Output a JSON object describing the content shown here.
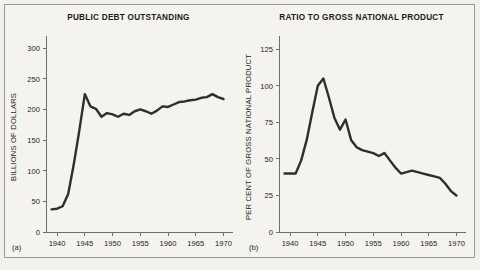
{
  "figure": {
    "background_color": "#f2f1ee",
    "frame_color": "#9a9a96",
    "line_color": "#2e2e2e",
    "axis_color": "#6e6e6b"
  },
  "panels": [
    {
      "tag": "(a)",
      "title": "PUBLIC DEBT OUTSTANDING"
    },
    {
      "tag": "(b)",
      "title": "RATIO TO GROSS NATIONAL PRODUCT"
    }
  ],
  "chart_data": [
    {
      "type": "line",
      "title": "PUBLIC DEBT OUTSTANDING",
      "panel_tag": "(a)",
      "xlabel": "",
      "ylabel": "BILLIONS OF DOLLARS",
      "xlim": [
        1938,
        1971
      ],
      "ylim": [
        0,
        310
      ],
      "xticks": [
        1940,
        1945,
        1950,
        1955,
        1960,
        1965,
        1970
      ],
      "xtick_labels": [
        "1940",
        "1945",
        "1950",
        "1955",
        "1960",
        "1965",
        "1970"
      ],
      "yticks": [
        0,
        50,
        100,
        150,
        200,
        250,
        300
      ],
      "ytick_labels": [
        "0",
        "50",
        "100",
        "150",
        "200",
        "250",
        "300"
      ],
      "grid": false,
      "legend": "none",
      "x": [
        1939,
        1940,
        1941,
        1942,
        1943,
        1944,
        1945,
        1946,
        1947,
        1948,
        1949,
        1950,
        1951,
        1952,
        1953,
        1954,
        1955,
        1956,
        1957,
        1958,
        1959,
        1960,
        1961,
        1962,
        1963,
        1964,
        1965,
        1966,
        1967,
        1968,
        1969,
        1970
      ],
      "values": [
        37,
        38,
        42,
        62,
        110,
        165,
        225,
        205,
        201,
        188,
        194,
        192,
        188,
        193,
        191,
        197,
        200,
        197,
        193,
        198,
        205,
        204,
        208,
        212,
        213,
        215,
        216,
        219,
        220,
        225,
        220,
        217
      ],
      "series": [
        {
          "name": "Public debt outstanding",
          "unit": "billions of dollars",
          "values": [
            37,
            38,
            42,
            62,
            110,
            165,
            225,
            205,
            201,
            188,
            194,
            192,
            188,
            193,
            191,
            197,
            200,
            197,
            193,
            198,
            205,
            204,
            208,
            212,
            213,
            215,
            216,
            219,
            220,
            225,
            220,
            217
          ]
        }
      ],
      "annotations": {
        "peak_year": 1945,
        "peak_value": 225
      }
    },
    {
      "type": "line",
      "title": "RATIO TO GROSS NATIONAL PRODUCT",
      "panel_tag": "(b)",
      "xlabel": "",
      "ylabel": "PER CENT OF GROSS NATIONAL PRODUCT",
      "xlim": [
        1938,
        1971
      ],
      "ylim": [
        0,
        130
      ],
      "xticks": [
        1940,
        1945,
        1950,
        1955,
        1960,
        1965,
        1970
      ],
      "xtick_labels": [
        "1940",
        "1945",
        "1950",
        "1955",
        "1960",
        "1965",
        "1970"
      ],
      "yticks": [
        0,
        25,
        50,
        75,
        100,
        125
      ],
      "ytick_labels": [
        "0",
        "25",
        "50",
        "75",
        "100",
        "125"
      ],
      "grid": false,
      "legend": "none",
      "x": [
        1939,
        1940,
        1941,
        1942,
        1943,
        1944,
        1945,
        1946,
        1947,
        1948,
        1949,
        1950,
        1951,
        1952,
        1953,
        1954,
        1955,
        1956,
        1957,
        1958,
        1959,
        1960,
        1961,
        1962,
        1963,
        1964,
        1965,
        1966,
        1967,
        1968,
        1969,
        1970
      ],
      "values": [
        40,
        40,
        40,
        49,
        63,
        82,
        100,
        105,
        92,
        78,
        70,
        77,
        63,
        58,
        56,
        55,
        54,
        52,
        54,
        49,
        44,
        40,
        41,
        42,
        41,
        40,
        39,
        38,
        37,
        33,
        28,
        25,
        19
      ],
      "series": [
        {
          "name": "Public debt as per cent of GNP",
          "unit": "per cent",
          "values": [
            40,
            40,
            40,
            49,
            63,
            82,
            100,
            105,
            92,
            78,
            70,
            77,
            63,
            58,
            56,
            55,
            54,
            52,
            54,
            49,
            44,
            40,
            41,
            42,
            41,
            40,
            39,
            38,
            37,
            33,
            28,
            25,
            19
          ]
        }
      ],
      "annotations": {
        "peak_year": 1946,
        "peak_value": 105,
        "secondary_peak_year": 1950,
        "secondary_peak_value": 77
      }
    }
  ]
}
